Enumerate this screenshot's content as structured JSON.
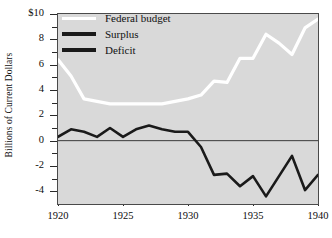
{
  "chart_data": {
    "type": "line",
    "title": "",
    "xlabel": "",
    "ylabel": "Billions of Current Dollars",
    "xlim": [
      1920,
      1940
    ],
    "ylim": [
      -5,
      10
    ],
    "grid": false,
    "legend_position": "upper-left-inside",
    "y_ticks": [
      {
        "value": 10,
        "label": "$10",
        "major": true
      },
      {
        "value": 9,
        "label": "",
        "major": false
      },
      {
        "value": 8,
        "label": "8",
        "major": true
      },
      {
        "value": 7,
        "label": "",
        "major": false
      },
      {
        "value": 6,
        "label": "6",
        "major": true
      },
      {
        "value": 5,
        "label": "",
        "major": false
      },
      {
        "value": 4,
        "label": "4",
        "major": true
      },
      {
        "value": 3,
        "label": "",
        "major": false
      },
      {
        "value": 2,
        "label": "2",
        "major": true
      },
      {
        "value": 1,
        "label": "",
        "major": false
      },
      {
        "value": 0,
        "label": "0",
        "major": true
      },
      {
        "value": -1,
        "label": "",
        "major": false
      },
      {
        "value": -2,
        "label": "-2",
        "major": true
      },
      {
        "value": -3,
        "label": "",
        "major": false
      },
      {
        "value": -4,
        "label": "-4",
        "major": true
      }
    ],
    "x_ticks": [
      {
        "value": 1920,
        "label": "1920"
      },
      {
        "value": 1925,
        "label": "1925"
      },
      {
        "value": 1930,
        "label": "1930"
      },
      {
        "value": 1935,
        "label": "1935"
      },
      {
        "value": 1940,
        "label": "1940"
      }
    ],
    "zero_line": 0,
    "x": [
      1920,
      1921,
      1922,
      1923,
      1924,
      1925,
      1926,
      1927,
      1928,
      1929,
      1930,
      1931,
      1932,
      1933,
      1934,
      1935,
      1936,
      1937,
      1938,
      1939,
      1940
    ],
    "series": [
      {
        "name": "Federal budget",
        "color": "#ffffff",
        "values": [
          6.4,
          5.1,
          3.3,
          3.1,
          2.9,
          2.9,
          2.9,
          2.9,
          2.9,
          3.1,
          3.3,
          3.6,
          4.7,
          4.6,
          6.5,
          6.5,
          8.4,
          7.7,
          6.8,
          8.9,
          9.6
        ]
      },
      {
        "name": "Surplus / Deficit",
        "color": "#1a1a1a",
        "values": [
          0.3,
          0.9,
          0.7,
          0.3,
          1.0,
          0.3,
          0.9,
          1.2,
          0.9,
          0.7,
          0.7,
          -0.5,
          -2.7,
          -2.6,
          -3.6,
          -2.8,
          -4.4,
          -2.8,
          -1.2,
          -3.9,
          -2.7
        ]
      }
    ],
    "legend": [
      {
        "label": "Federal budget",
        "color": "#ffffff",
        "style": "thin"
      },
      {
        "label": "Surplus",
        "color": "#1a1a1a",
        "style": "thick"
      },
      {
        "label": "Deficit",
        "color": "#1a1a1a",
        "style": "thick"
      }
    ],
    "colors": {
      "plot_background": "#d9d9d9",
      "frame": "#4a4a4a",
      "page_background": "#ffffff",
      "text": "#111111"
    }
  }
}
